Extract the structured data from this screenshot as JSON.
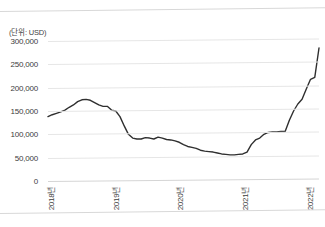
{
  "figure": {
    "title": "",
    "unit_label": "(단위: USD)",
    "line_color": "#2f2f2f",
    "grid_color": "#e6e6e6",
    "background": "#ffffff"
  },
  "chart_data": {
    "type": "line",
    "title": "",
    "xlabel": "",
    "ylabel": "(단위: USD)",
    "ylim": [
      0,
      300000
    ],
    "yticks": [
      0,
      50000,
      100000,
      150000,
      200000,
      250000,
      300000
    ],
    "ytick_labels": [
      "0",
      "50,000",
      "100,000",
      "150,000",
      "200,000",
      "250,000",
      "300,000"
    ],
    "xtick_labels": [
      "2018년",
      "2019년",
      "2020년",
      "2021년",
      "2022년"
    ],
    "xtick_positions": [
      0,
      12,
      24,
      36,
      48
    ],
    "grid": true,
    "legend": "none",
    "series": [
      {
        "name": "USD",
        "x": [
          0,
          1,
          2,
          3,
          4,
          5,
          6,
          7,
          8,
          9,
          10,
          11,
          12,
          13,
          14,
          15,
          16,
          17,
          18,
          19,
          20,
          21,
          22,
          23,
          24,
          25,
          26,
          27,
          28,
          29,
          30,
          31,
          32,
          33,
          34,
          35,
          36,
          37,
          38,
          39,
          40,
          41,
          42,
          43,
          44,
          45,
          46,
          47,
          48,
          49
        ],
        "values": [
          138000,
          142000,
          145000,
          148000,
          152000,
          158000,
          163000,
          170000,
          174000,
          175000,
          173000,
          168000,
          163000,
          160000,
          160000,
          152000,
          150000,
          138000,
          118000,
          100000,
          92000,
          90000,
          90000,
          93000,
          92000,
          90000,
          94000,
          92000,
          89000,
          88000,
          86000,
          83000,
          78000,
          74000,
          72000,
          70000,
          66000,
          64000,
          63000,
          62000,
          60000,
          58000,
          57000,
          56000,
          56000,
          57000,
          58000,
          62000,
          78000,
          88000
        ]
      }
    ],
    "tail": {
      "note": "final steep rise continues to 2022",
      "values": [
        92000,
        100000,
        104000,
        105000,
        105000,
        106000,
        106000,
        130000,
        150000,
        165000,
        175000,
        197000,
        218000,
        222000,
        285000
      ]
    }
  }
}
